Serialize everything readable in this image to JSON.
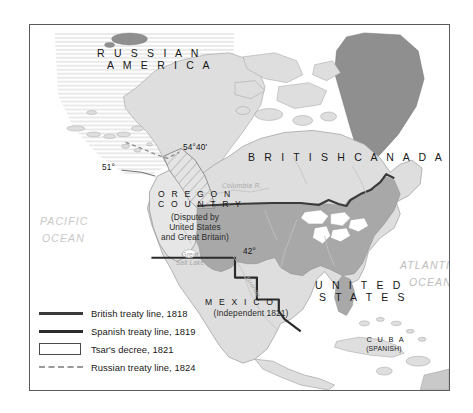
{
  "map": {
    "regions": [
      {
        "id": "russian-america",
        "name": "RUSSIAN AMERICA",
        "line1": "R U S S I A N",
        "line2": "A M E R I C A"
      },
      {
        "id": "british-canada",
        "name": "BRITISH CANADA",
        "line1": "B R I T I S H   C A N A D A"
      },
      {
        "id": "oregon-country",
        "name": "OREGON COUNTRY",
        "line1": "O R E G O N",
        "line2": "C O U N T R Y",
        "sub1": "(Disputed by",
        "sub2": "United States",
        "sub3": "and Great Britain)"
      },
      {
        "id": "united-states",
        "name": "UNITED STATES",
        "line1": "U N I T E D",
        "line2": "S T A T E S"
      },
      {
        "id": "mexico",
        "name": "MEXICO",
        "line1": "M E X I C O",
        "sub1": "(Independent 1821)"
      },
      {
        "id": "cuba",
        "name": "CUBA",
        "line1": "C U B A",
        "sub1": "(SPANISH)"
      }
    ],
    "oceans": [
      {
        "id": "pacific-ocean",
        "line1": "PACIFIC",
        "line2": "OCEAN"
      },
      {
        "id": "atlantic-ocean",
        "line1": "ATLANTIC",
        "line2": "OCEAN"
      }
    ],
    "latitudes": [
      {
        "id": "lat-54-40",
        "label": "54°40'"
      },
      {
        "id": "lat-51",
        "label": "51°"
      },
      {
        "id": "lat-42",
        "label": "42°"
      }
    ],
    "hydrography": [
      {
        "id": "columbia-river",
        "label": "Columbia R."
      },
      {
        "id": "great-salt-lake",
        "line1": "Great",
        "line2": "Salt Lake"
      },
      {
        "id": "rio-grande",
        "label": "Grande"
      }
    ]
  },
  "legend": {
    "items": [
      {
        "id": "british-treaty-line",
        "key": "solid-line",
        "label": "British treaty line, 1818",
        "color": "#3a3a3a"
      },
      {
        "id": "spanish-treaty-line",
        "key": "solid-line",
        "label": "Spanish treaty line, 1819",
        "color": "#2b2b2b"
      },
      {
        "id": "tsars-decree",
        "key": "open-box",
        "label": "Tsar's decree, 1821",
        "color": "#4a4a4a"
      },
      {
        "id": "russian-treaty-line",
        "key": "dashed-line",
        "label": "Russian treaty line, 1824",
        "color": "#9a9a9a"
      }
    ]
  },
  "palette": {
    "land_light": "#dedede",
    "land_us": "#a8a8a8",
    "land_greenland": "#8f8f8f",
    "water": "#ffffff",
    "frame": "#5b5b5b",
    "border_line": "#3a3a3a"
  }
}
